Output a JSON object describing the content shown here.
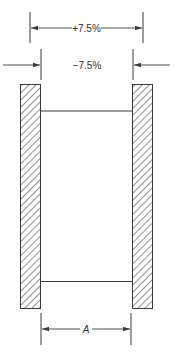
{
  "diagram": {
    "type": "engineering-tolerance-drawing",
    "colors": {
      "line": "#3a3a3a",
      "hatch": "#3a3a3a",
      "background": "#ffffff"
    },
    "dimensions": {
      "outer": {
        "label": "+7.5%",
        "style": "inside-arrows"
      },
      "inner": {
        "label": "−7.5%",
        "style": "outside-arrows"
      },
      "nominal": {
        "label": "A",
        "style": "inside-arrows"
      }
    },
    "elements": {
      "left_wall": "hatched-wall-left",
      "right_wall": "hatched-wall-right",
      "top_span": "horizontal-member-top",
      "bottom_span": "horizontal-member-bottom"
    }
  }
}
